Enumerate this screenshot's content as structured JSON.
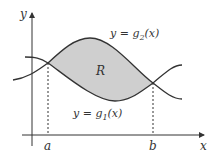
{
  "figure": {
    "axes": {
      "x_label": "x",
      "y_label": "y"
    },
    "region_label": "R",
    "curves": {
      "upper": {
        "label": "y = g",
        "sub": "2",
        "suffix": "(x)"
      },
      "lower": {
        "label": "y = g",
        "sub": "1",
        "suffix": "(x)"
      }
    },
    "points": {
      "a": "a",
      "b": "b"
    },
    "colors": {
      "region_fill": "#cfcfcf",
      "stroke": "#333333"
    }
  }
}
